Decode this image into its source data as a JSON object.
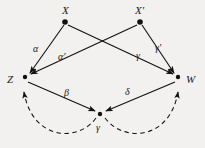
{
  "diagram": {
    "background_color": "#f2f1ef",
    "stroke_color": "#1a1a1a",
    "nodes": [
      {
        "id": "X",
        "label": "X",
        "x": 65,
        "y": 22,
        "label_x": 62,
        "label_y": 13
      },
      {
        "id": "Xprime",
        "label": "X'",
        "x": 140,
        "y": 22,
        "label_x": 136,
        "label_y": 13
      },
      {
        "id": "Z",
        "label": "Z",
        "x": 25,
        "y": 77,
        "label_x": 8,
        "label_y": 82
      },
      {
        "id": "W",
        "label": "W",
        "x": 178,
        "y": 77,
        "label_x": 186,
        "label_y": 82
      },
      {
        "id": "Y",
        "label": "γ",
        "x": 100,
        "y": 114,
        "label_x": 99,
        "label_y": 128
      }
    ],
    "edges": [
      {
        "id": "alpha",
        "label": "α",
        "from": "X",
        "to": "Z",
        "label_x": 36,
        "label_y": 49,
        "style": "solid"
      },
      {
        "id": "alpha-prime",
        "label": "α'",
        "from": "Xprime",
        "to": "Z",
        "label_x": 62,
        "label_y": 57,
        "style": "solid"
      },
      {
        "id": "gamma",
        "label": "γ",
        "from": "X",
        "to": "W",
        "label_x": 139,
        "label_y": 56,
        "style": "solid"
      },
      {
        "id": "gamma-prime",
        "label": "γ'",
        "from": "Xprime",
        "to": "W",
        "label_x": 158,
        "label_y": 48,
        "style": "solid"
      },
      {
        "id": "beta",
        "label": "β",
        "from": "Z",
        "to": "Y",
        "label_x": 67,
        "label_y": 93,
        "style": "solid"
      },
      {
        "id": "delta",
        "label": "δ",
        "from": "W",
        "to": "Y",
        "label_x": 128,
        "label_y": 92,
        "style": "solid"
      },
      {
        "id": "arc-left",
        "label": "",
        "from": "Y",
        "to": "Z",
        "label_x": 0,
        "label_y": 0,
        "style": "dashed"
      },
      {
        "id": "arc-right",
        "label": "",
        "from": "Y",
        "to": "W",
        "label_x": 0,
        "label_y": 0,
        "style": "dashed"
      }
    ]
  }
}
